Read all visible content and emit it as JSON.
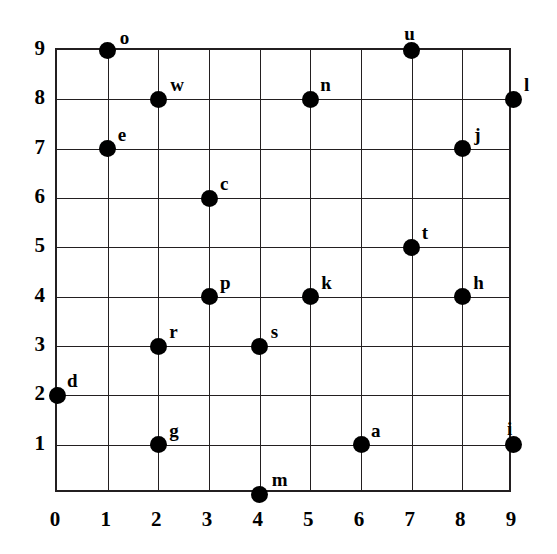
{
  "chart_data": {
    "type": "scatter",
    "title": "",
    "subtitle": "",
    "xlabel": "",
    "ylabel": "",
    "xlim": [
      0,
      9
    ],
    "ylim": [
      0,
      9
    ],
    "grid": true,
    "legend": false,
    "x_ticks": [
      "0",
      "1",
      "2",
      "3",
      "4",
      "5",
      "6",
      "7",
      "8",
      "9"
    ],
    "y_ticks": [
      "1",
      "2",
      "3",
      "4",
      "5",
      "6",
      "7",
      "8",
      "9"
    ],
    "x_tick_values": [
      0,
      1,
      2,
      3,
      4,
      5,
      6,
      7,
      8,
      9
    ],
    "y_tick_values": [
      1,
      2,
      3,
      4,
      5,
      6,
      7,
      8,
      9
    ],
    "marker_color": "#000000",
    "marker_shape": "circle",
    "grid_color": "#231f20",
    "background_color": "#ffffff",
    "points": [
      {
        "label": "o",
        "x": 1,
        "y": 9,
        "label_dx": 14,
        "label_dy": -20
      },
      {
        "label": "u",
        "x": 7,
        "y": 9,
        "label_dx": 0,
        "label_dy": -24
      },
      {
        "label": "w",
        "x": 2,
        "y": 8,
        "label_dx": 14,
        "label_dy": -22
      },
      {
        "label": "n",
        "x": 5,
        "y": 8,
        "label_dx": 12,
        "label_dy": -22
      },
      {
        "label": "l",
        "x": 9,
        "y": 8,
        "label_dx": 13,
        "label_dy": -22
      },
      {
        "label": "e",
        "x": 1,
        "y": 7,
        "label_dx": 12,
        "label_dy": -22
      },
      {
        "label": "j",
        "x": 8,
        "y": 7,
        "label_dx": 14,
        "label_dy": -22
      },
      {
        "label": "c",
        "x": 3,
        "y": 6,
        "label_dx": 13,
        "label_dy": -22
      },
      {
        "label": "t",
        "x": 7,
        "y": 5,
        "label_dx": 12,
        "label_dy": -22
      },
      {
        "label": "p",
        "x": 3,
        "y": 4,
        "label_dx": 13,
        "label_dy": -22
      },
      {
        "label": "k",
        "x": 5,
        "y": 4,
        "label_dx": 13,
        "label_dy": -22
      },
      {
        "label": "h",
        "x": 8,
        "y": 4,
        "label_dx": 13,
        "label_dy": -22
      },
      {
        "label": "r",
        "x": 2,
        "y": 3,
        "label_dx": 13,
        "label_dy": -22
      },
      {
        "label": "s",
        "x": 4,
        "y": 3,
        "label_dx": 13,
        "label_dy": -22
      },
      {
        "label": "d",
        "x": 0,
        "y": 2,
        "label_dx": 12,
        "label_dy": -22
      },
      {
        "label": "g",
        "x": 2,
        "y": 1,
        "label_dx": 13,
        "label_dy": -22
      },
      {
        "label": "a",
        "x": 6,
        "y": 1,
        "label_dx": 12,
        "label_dy": -22
      },
      {
        "label": "i",
        "x": 9,
        "y": 1,
        "label_dx": -4,
        "label_dy": -24
      },
      {
        "label": "m",
        "x": 4,
        "y": 0,
        "label_dx": 14,
        "label_dy": -22
      }
    ]
  }
}
